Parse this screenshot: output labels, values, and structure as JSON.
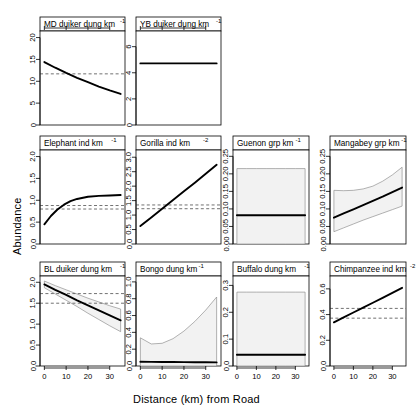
{
  "figure": {
    "xlabel": "Distance (km) from Road",
    "ylabel": "Abundance",
    "background": "#ffffff",
    "line_color": "#000000",
    "band_fill": "#f2f2f2",
    "band_stroke": "#808080",
    "ref_line_color": "#4d4d4d"
  },
  "chart_data": {
    "type": "line",
    "title": "",
    "xlabel": "Distance (km) from Road",
    "ylabel": "Abundance",
    "xlim": [
      -2,
      37
    ],
    "grid": false,
    "legend": null,
    "layout": {
      "rows": 3,
      "cols": 4,
      "note": "row1 has only 2 panels (cols 1-2)"
    },
    "panels": [
      {
        "id": "md-duiker",
        "row": 1,
        "col": 1,
        "strip_label": "MD duiker dung km",
        "strip_exponent": "-1",
        "xticks": [
          0,
          10,
          20,
          30
        ],
        "xticks_top": true,
        "yticks": [
          0,
          5,
          10,
          15,
          20
        ],
        "ylim": [
          0,
          21.5
        ],
        "x": [
          0,
          5,
          10,
          15,
          20,
          25,
          30,
          35
        ],
        "fit": [
          14.4,
          13.1,
          11.9,
          10.8,
          9.8,
          8.8,
          7.9,
          7.1
        ],
        "band_lower": null,
        "band_upper": null,
        "ref_lines": [
          11.7
        ]
      },
      {
        "id": "yb-duiker",
        "row": 1,
        "col": 2,
        "strip_label": "YB duiker dung km",
        "strip_exponent": "-1",
        "xticks": [
          0,
          10,
          20,
          30
        ],
        "xticks_top": true,
        "yticks": [
          0,
          2,
          4,
          6
        ],
        "ylim": [
          0,
          7.2
        ],
        "x": [
          0,
          5,
          10,
          15,
          20,
          25,
          30,
          35
        ],
        "fit": [
          4.72,
          4.72,
          4.72,
          4.72,
          4.72,
          4.72,
          4.72,
          4.72
        ],
        "band_lower": null,
        "band_upper": null,
        "ref_lines": []
      },
      {
        "id": "elephant",
        "row": 2,
        "col": 1,
        "strip_label": "Elephant ind km",
        "strip_exponent": "-1",
        "xticks": [
          0,
          10,
          20,
          30
        ],
        "xticks_top": false,
        "yticks": [
          0.0,
          0.5,
          1.0,
          1.5,
          2.0
        ],
        "ylim": [
          0.0,
          2.15
        ],
        "x": [
          0,
          3,
          6,
          9,
          12,
          15,
          20,
          25,
          30,
          35
        ],
        "fit": [
          0.45,
          0.64,
          0.79,
          0.9,
          0.98,
          1.03,
          1.08,
          1.1,
          1.11,
          1.12
        ],
        "band_lower": null,
        "band_upper": null,
        "ref_lines": [
          0.88,
          0.8
        ]
      },
      {
        "id": "gorilla",
        "row": 2,
        "col": 2,
        "strip_label": "Gorilla ind km",
        "strip_exponent": "-2",
        "xticks": [
          0,
          10,
          20,
          30
        ],
        "xticks_top": false,
        "yticks": [
          0.0,
          0.5,
          1.0,
          1.5,
          2.0,
          2.5,
          3.0
        ],
        "ylim": [
          0.0,
          3.25
        ],
        "x": [
          0,
          5,
          10,
          15,
          20,
          25,
          30,
          35
        ],
        "fit": [
          0.62,
          0.92,
          1.22,
          1.52,
          1.82,
          2.12,
          2.43,
          2.74
        ],
        "band_lower": null,
        "band_upper": null,
        "ref_lines": [
          1.35,
          1.22
        ]
      },
      {
        "id": "guenon",
        "row": 2,
        "col": 3,
        "strip_label": "Guenon grp km",
        "strip_exponent": "-1",
        "xticks": [
          0,
          10,
          20,
          30
        ],
        "xticks_top": false,
        "yticks": [
          0.0,
          0.05,
          0.1,
          0.15,
          0.2,
          0.25
        ],
        "ylim": [
          0.0,
          0.268
        ],
        "x": [
          0,
          5,
          10,
          15,
          20,
          25,
          30,
          35
        ],
        "fit": [
          0.082,
          0.082,
          0.082,
          0.082,
          0.082,
          0.082,
          0.082,
          0.082
        ],
        "band_lower": [
          0.0,
          0.0,
          0.0,
          0.0,
          0.0,
          0.0,
          0.0,
          0.0
        ],
        "band_upper": [
          0.215,
          0.215,
          0.215,
          0.215,
          0.215,
          0.215,
          0.215,
          0.215
        ],
        "ref_lines": []
      },
      {
        "id": "mangabey",
        "row": 2,
        "col": 4,
        "strip_label": "Mangabey grp km",
        "strip_exponent": "-1",
        "xticks": [
          0,
          10,
          20,
          30
        ],
        "xticks_top": false,
        "yticks": [
          0.0,
          0.05,
          0.1,
          0.15,
          0.2,
          0.25
        ],
        "ylim": [
          0.0,
          0.268
        ],
        "x": [
          0,
          5,
          10,
          15,
          20,
          25,
          30,
          35
        ],
        "fit": [
          0.075,
          0.087,
          0.099,
          0.111,
          0.123,
          0.135,
          0.148,
          0.161
        ],
        "band_lower": [
          0.035,
          0.046,
          0.057,
          0.068,
          0.078,
          0.088,
          0.098,
          0.108
        ],
        "band_upper": [
          0.153,
          0.152,
          0.153,
          0.157,
          0.165,
          0.179,
          0.197,
          0.219
        ],
        "ref_lines": []
      },
      {
        "id": "bl-duiker",
        "row": 3,
        "col": 1,
        "strip_label": "BL duiker dung km",
        "strip_exponent": "-1",
        "xticks": [
          0,
          10,
          20,
          30
        ],
        "xticks_top": false,
        "yticks": [
          0.0,
          0.5,
          1.0,
          1.5,
          2.0
        ],
        "ylim": [
          0.0,
          2.15
        ],
        "x": [
          0,
          5,
          10,
          15,
          20,
          25,
          30,
          35
        ],
        "fit": [
          1.95,
          1.82,
          1.7,
          1.57,
          1.45,
          1.33,
          1.21,
          1.09
        ],
        "band_lower": [
          1.87,
          1.72,
          1.57,
          1.42,
          1.26,
          1.11,
          0.96,
          0.82
        ],
        "band_upper": [
          2.03,
          1.92,
          1.82,
          1.72,
          1.62,
          1.53,
          1.44,
          1.36
        ],
        "ref_lines": [
          1.73,
          1.5
        ]
      },
      {
        "id": "bongo",
        "row": 3,
        "col": 2,
        "strip_label": "Bongo dung km",
        "strip_exponent": "-1",
        "xticks": [
          0,
          10,
          20,
          30
        ],
        "xticks_top": false,
        "yticks": [
          0.0,
          0.2,
          0.4,
          0.6,
          0.8,
          1.0
        ],
        "ylim": [
          0.0,
          1.07
        ],
        "x": [
          0,
          5,
          10,
          15,
          20,
          25,
          30,
          35
        ],
        "fit": [
          0.05,
          0.049,
          0.048,
          0.047,
          0.046,
          0.045,
          0.044,
          0.043
        ],
        "band_lower": [
          0.0,
          0.0,
          0.0,
          0.0,
          0.0,
          0.0,
          0.0,
          0.0
        ],
        "band_upper": [
          0.335,
          0.262,
          0.27,
          0.325,
          0.415,
          0.53,
          0.665,
          0.82
        ],
        "ref_lines": []
      },
      {
        "id": "buffalo",
        "row": 3,
        "col": 3,
        "strip_label": "Buffalo dung km",
        "strip_exponent": "-1",
        "xticks": [
          0,
          10,
          20,
          30
        ],
        "xticks_top": false,
        "yticks": [
          0.0,
          0.1,
          0.2,
          0.3
        ],
        "ylim": [
          0.0,
          0.335
        ],
        "x": [
          0,
          5,
          10,
          15,
          20,
          25,
          30,
          35
        ],
        "fit": [
          0.042,
          0.042,
          0.042,
          0.042,
          0.042,
          0.042,
          0.042,
          0.042
        ],
        "band_lower": [
          0.0,
          0.0,
          0.0,
          0.0,
          0.0,
          0.0,
          0.0,
          0.0
        ],
        "band_upper": [
          0.275,
          0.275,
          0.275,
          0.275,
          0.275,
          0.275,
          0.275,
          0.275
        ],
        "ref_lines": []
      },
      {
        "id": "chimpanzee",
        "row": 3,
        "col": 4,
        "strip_label": "Chimpanzee ind km",
        "strip_exponent": "-2",
        "xticks": [
          0,
          10,
          20,
          30
        ],
        "xticks_top": false,
        "yticks": [
          0.0,
          0.2,
          0.4,
          0.6
        ],
        "ylim": [
          0.0,
          0.7
        ],
        "x": [
          0,
          5,
          10,
          15,
          20,
          25,
          30,
          35
        ],
        "fit": [
          0.34,
          0.378,
          0.416,
          0.454,
          0.492,
          0.53,
          0.568,
          0.608
        ],
        "band_lower": null,
        "band_upper": null,
        "ref_lines": [
          0.448,
          0.372
        ]
      }
    ]
  }
}
